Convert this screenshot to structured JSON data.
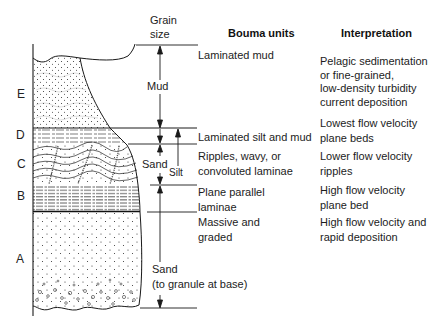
{
  "headers": {
    "grain_size": "Grain\nsize",
    "grain_size_line1": "Grain",
    "grain_size_line2": "size",
    "bouma_units": "Bouma units",
    "interpretation": "Interpretation"
  },
  "unit_letters": [
    "E",
    "D",
    "C",
    "B",
    "A"
  ],
  "grain_labels": {
    "mud": "Mud",
    "sand_upper": "Sand",
    "silt": "Silt",
    "sand_lower_line1": "Sand",
    "sand_lower_line2": "(to granule at base)"
  },
  "units": [
    {
      "letter": "E",
      "bouma": [
        "Laminated mud"
      ],
      "interpretation": [
        "Pelagic sedimentation",
        "or fine-grained,",
        "low-density turbidity",
        "current deposition"
      ]
    },
    {
      "letter": "D",
      "bouma": [
        "Laminated silt and mud"
      ],
      "interpretation": [
        "Lowest flow velocity",
        "plane beds"
      ]
    },
    {
      "letter": "C",
      "bouma": [
        "Ripples, wavy, or",
        "convoluted laminae"
      ],
      "interpretation": [
        "Lower flow velocity",
        "ripples"
      ]
    },
    {
      "letter": "B",
      "bouma": [
        "Plane parallel",
        "laminae"
      ],
      "interpretation": [
        "High flow velocity",
        "plane bed"
      ]
    },
    {
      "letter": "A",
      "bouma": [
        "Massive and",
        "graded"
      ],
      "interpretation": [
        "High flow velocity and",
        "rapid deposition"
      ]
    }
  ]
}
